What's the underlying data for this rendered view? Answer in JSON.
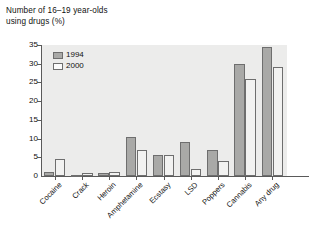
{
  "chart_data": {
    "type": "bar",
    "title": "Number of 16–19 year-olds\nusing drugs (%)",
    "xlabel": "",
    "ylabel": "",
    "ylim": [
      0,
      35
    ],
    "ytick_step": 5,
    "grid": false,
    "legend_position": "top-left",
    "categories": [
      "Cocaine",
      "Crack",
      "Heroin",
      "Amphetamine",
      "Ecstasy",
      "LSD",
      "Poppers",
      "Cannabis",
      "Any drug"
    ],
    "ytick_labels": [
      "0",
      "5",
      "10",
      "15",
      "20",
      "25",
      "30",
      "35"
    ],
    "series": [
      {
        "name": "1994",
        "color": "#a9a9a7",
        "values": [
          1,
          0.4,
          0.9,
          10.5,
          5.5,
          9,
          7,
          30,
          34.5
        ]
      },
      {
        "name": "2000",
        "color": "#f2f2f1",
        "values": [
          4.5,
          0.9,
          1.2,
          7,
          5.5,
          2,
          4,
          26,
          29
        ]
      }
    ]
  },
  "legend": {
    "entries": [
      {
        "label": "1994"
      },
      {
        "label": "2000"
      }
    ]
  },
  "colors": {
    "plot_background": "#ececeb",
    "axis": "#5a5a5a",
    "series_1994": "#a9a9a7",
    "series_2000": "#f2f2f1",
    "text": "#111111"
  }
}
